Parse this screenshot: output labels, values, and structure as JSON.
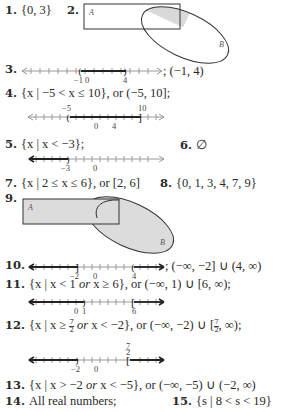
{
  "items": [
    {
      "id": "1",
      "label": "1.",
      "text": "{0, 3}"
    },
    {
      "id": "2",
      "label": "2.",
      "venn": {
        "set_a": "A",
        "set_b": "B",
        "shaded": "A ∩ B"
      }
    },
    {
      "id": "3",
      "label": "3.",
      "text": "; (−1, 4)",
      "numberline": {
        "ticks": [
          "−1",
          "0",
          "4"
        ],
        "left_bracket": "(",
        "right_bracket": ")"
      }
    },
    {
      "id": "4",
      "label": "4.",
      "text": "{x | −5 < x ≤ 10}, or (−5, 10];",
      "numberline": {
        "ticks_above": [
          "−5",
          "10"
        ],
        "ticks_below": [
          "0",
          "4"
        ],
        "left_bracket": "(",
        "right_bracket": "]"
      }
    },
    {
      "id": "5",
      "label": "5.",
      "text": "{x | x < −3};",
      "numberline": {
        "ticks": [
          "−3",
          "0"
        ],
        "right_bracket": ")"
      }
    },
    {
      "id": "6",
      "label": "6.",
      "text": "∅"
    },
    {
      "id": "7",
      "label": "7.",
      "text": "{x | 2 ≤ x ≤ 6}, or [2, 6]"
    },
    {
      "id": "8",
      "label": "8.",
      "text": "{0, 1, 3, 4, 7, 9}"
    },
    {
      "id": "9",
      "label": "9.",
      "venn": {
        "set_a": "A",
        "set_b": "B",
        "shaded": "A ∪ B"
      }
    },
    {
      "id": "10",
      "label": "10.",
      "text": "; (−∞, −2] ∪ (4, ∞)",
      "numberline": {
        "ticks": [
          "−2",
          "0",
          "4"
        ],
        "brackets": [
          "]",
          "("
        ]
      }
    },
    {
      "id": "11",
      "label": "11.",
      "text_pre": "{x | x < 1 ",
      "text_or": "or",
      "text_post": " x ≥ 6}, or (−∞, 1) ∪ [6, ∞);",
      "numberline": {
        "ticks": [
          "0",
          "1",
          "6"
        ],
        "brackets": [
          ")",
          "["
        ]
      }
    },
    {
      "id": "12",
      "label": "12.",
      "text_pre": "{x | x ≥ ",
      "frac_num": "7",
      "frac_den": "2",
      "text_or": " or ",
      "text_mid": "x < −2}, or (−∞, −2) ∪ [",
      "text_post": ", ∞);",
      "numberline": {
        "ticks": [
          "−2",
          "0"
        ],
        "tick_above": "7/2",
        "brackets": [
          ")",
          "["
        ]
      }
    },
    {
      "id": "13",
      "label": "13.",
      "text_pre": "{x | x > −2 ",
      "text_or": "or",
      "text_post": " x < −5}, or (−∞, −5) ∪ (−2, ∞)"
    },
    {
      "id": "14",
      "label": "14.",
      "text": "All real numbers;"
    },
    {
      "id": "15",
      "label": "15.",
      "text": "{s | 8 < s < 19}"
    }
  ],
  "colors": {
    "ink": "#2a2a2a",
    "shade": "#d9d9d9",
    "line": "#333333"
  }
}
